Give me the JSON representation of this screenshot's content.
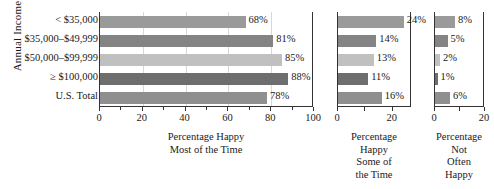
{
  "chart_data": {
    "type": "bar",
    "orientation": "horizontal",
    "title": "",
    "ylabel": "Annual Income",
    "categories": [
      "< $35,000",
      "$35,000–$49,999",
      "$50,000–$99,999",
      "≥ $100,000",
      "U.S. Total"
    ],
    "panels": [
      {
        "name": "percentage-happy-most-of-the-time",
        "xlabel_lines": [
          "Percentage Happy",
          "Most of the Time"
        ],
        "xlim": [
          0,
          100
        ],
        "xticks": [
          0,
          20,
          40,
          60,
          80,
          100
        ],
        "xtick_labels": [
          "0",
          "20",
          "40",
          "60",
          "80",
          "100"
        ],
        "minor_tick_step": 10,
        "grid": true,
        "values": [
          68,
          81,
          85,
          88,
          78
        ],
        "value_labels": [
          "68%",
          "81%",
          "85%",
          "88%",
          "78%"
        ]
      },
      {
        "name": "percentage-happy-some-of-the-time",
        "xlabel_lines": [
          "Percentage",
          "Happy",
          "Some of",
          "the Time"
        ],
        "xlim": [
          0,
          27
        ],
        "xticks": [
          0,
          10,
          20
        ],
        "xtick_labels": [
          "0",
          "",
          "20"
        ],
        "minor_tick_step": 10,
        "grid": false,
        "values": [
          24,
          14,
          13,
          11,
          16
        ],
        "value_labels": [
          "24%",
          "14%",
          "13%",
          "11%",
          "16%"
        ]
      },
      {
        "name": "percentage-not-often-happy",
        "xlabel_lines": [
          "Percentage",
          "Not",
          "Often",
          "Happy"
        ],
        "xlim": [
          0,
          20
        ],
        "xticks": [
          0,
          10,
          20
        ],
        "xtick_labels": [
          "0",
          "",
          "20"
        ],
        "minor_tick_step": 10,
        "grid": false,
        "values": [
          8,
          5,
          2,
          1,
          6
        ],
        "value_labels": [
          "8%",
          "5%",
          "2%",
          "1%",
          "6%"
        ]
      }
    ],
    "series_colors": [
      "#9a9a9a",
      "#848484",
      "#c0c0c0",
      "#6e6e6e",
      "#8f8f8f"
    ],
    "axis_color": "#333333",
    "grid_color": "#d8d8d8"
  }
}
